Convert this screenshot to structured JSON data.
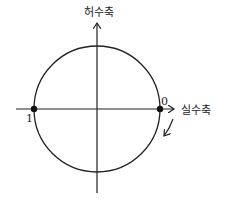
{
  "diagram": {
    "type": "complex-plane-unit-circle",
    "imaginary_axis_label": "허수축",
    "real_axis_label": "실수축",
    "points": [
      {
        "label": "1",
        "position": "left intersection of circle and real axis"
      },
      {
        "label": "0",
        "position": "right intersection of circle and real axis"
      }
    ],
    "rotation_arrow": "clockwise, downward from point 0",
    "colors": {
      "stroke": "#222222",
      "background": "#ffffff"
    }
  }
}
